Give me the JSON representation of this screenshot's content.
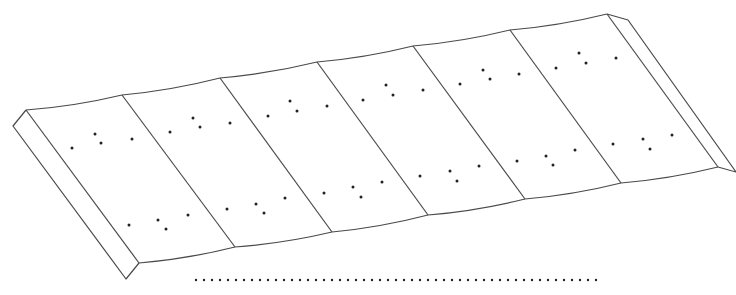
{
  "figure": {
    "type": "patent-style line drawing",
    "stroke_color": "#4a4a4a",
    "dot_color": "#222222",
    "background": "#ffffff",
    "panel_count": 6,
    "top_edge": [
      [
        26,
        110
      ],
      [
        122,
        95
      ],
      [
        220,
        78
      ],
      [
        317,
        62
      ],
      [
        413,
        46
      ],
      [
        510,
        30
      ],
      [
        607,
        14
      ]
    ],
    "bottom_edge": [
      [
        139,
        263
      ],
      [
        235,
        247
      ],
      [
        332,
        232
      ],
      [
        428,
        215
      ],
      [
        525,
        199
      ],
      [
        621,
        183
      ],
      [
        718,
        167
      ]
    ],
    "left_flange": [
      [
        26,
        110
      ],
      [
        13,
        126
      ],
      [
        126,
        279
      ],
      [
        139,
        263
      ]
    ],
    "right_flange": [
      [
        607,
        14
      ],
      [
        628,
        20
      ],
      [
        736,
        172
      ],
      [
        718,
        167
      ]
    ],
    "dot_groups": [
      [
        [
          72,
          148
        ],
        [
          95,
          134
        ],
        [
          101,
          143
        ],
        [
          132,
          139
        ],
        [
          129,
          225
        ],
        [
          158,
          220
        ],
        [
          166,
          229
        ],
        [
          188,
          215
        ]
      ],
      [
        [
          170,
          132
        ],
        [
          193,
          118
        ],
        [
          200,
          127
        ],
        [
          230,
          123
        ],
        [
          227,
          209
        ],
        [
          256,
          204
        ],
        [
          264,
          213
        ],
        [
          285,
          198
        ]
      ],
      [
        [
          268,
          116
        ],
        [
          290,
          101
        ],
        [
          297,
          111
        ],
        [
          327,
          106
        ],
        [
          324,
          193
        ],
        [
          353,
          187
        ],
        [
          361,
          197
        ],
        [
          382,
          182
        ]
      ],
      [
        [
          363,
          100
        ],
        [
          386,
          85
        ],
        [
          393,
          95
        ],
        [
          423,
          90
        ],
        [
          420,
          176
        ],
        [
          450,
          171
        ],
        [
          457,
          181
        ],
        [
          479,
          166
        ]
      ],
      [
        [
          460,
          84
        ],
        [
          483,
          70
        ],
        [
          490,
          79
        ],
        [
          519,
          74
        ],
        [
          517,
          161
        ],
        [
          546,
          156
        ],
        [
          553,
          165
        ],
        [
          575,
          150
        ]
      ],
      [
        [
          556,
          68
        ],
        [
          579,
          53
        ],
        [
          586,
          63
        ],
        [
          616,
          58
        ],
        [
          613,
          144
        ],
        [
          643,
          139
        ],
        [
          650,
          149
        ],
        [
          672,
          135
        ]
      ]
    ],
    "dotted_line": {
      "x1": 196,
      "x2": 603,
      "y": 280,
      "spacing": 8
    }
  }
}
